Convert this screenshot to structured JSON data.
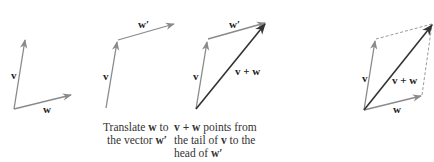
{
  "diagram": {
    "colors": {
      "vector": "#8a8a8a",
      "sum": "#333333",
      "dashed": "#9a9a9a",
      "text": "#222222"
    },
    "panels": [
      {
        "id": "panel-1",
        "labels": {
          "v": "v",
          "w": "w"
        }
      },
      {
        "id": "panel-2",
        "labels": {
          "v": "v",
          "w_prime": "w′"
        },
        "caption": {
          "line1_pre": "Translate ",
          "line1_bold": "w",
          "line1_post": " to",
          "line2_pre": "the vector ",
          "line2_bold": "w′"
        }
      },
      {
        "id": "panel-3",
        "labels": {
          "v": "v",
          "w_prime": "w′",
          "sum": "v + w"
        },
        "caption": {
          "line1_bold": "v + w",
          "line1_post": " points from",
          "line2_pre": "the tail  of ",
          "line2_bold": "v",
          "line2_post": " to the",
          "line3_pre": "head of ",
          "line3_bold": "w′"
        }
      },
      {
        "id": "panel-4",
        "labels": {
          "v": "v",
          "w": "w",
          "sum": "v + w"
        }
      }
    ]
  }
}
